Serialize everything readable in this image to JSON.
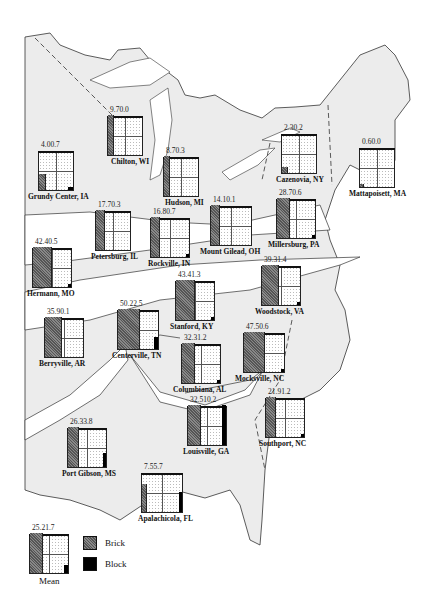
{
  "legend": {
    "brick": "Brick",
    "block": "Block"
  },
  "colors": {
    "land": "#ececec",
    "brick": "#6a6a6a",
    "block": "#000000",
    "border": "#222222"
  },
  "mean": {
    "label": "Mean",
    "brick": "25.2",
    "block": "1.7"
  },
  "sites": [
    {
      "name": "Grundy Center, IA",
      "brick": "4.0",
      "block": "0.7"
    },
    {
      "name": "Chilton, WI",
      "brick": "9.7",
      "block": "0.0"
    },
    {
      "name": "Hudson, MI",
      "brick": "8.7",
      "block": "0.3"
    },
    {
      "name": "Cazenovia, NY",
      "brick": "2.3",
      "block": "0.2"
    },
    {
      "name": "Mattapoisett, MA",
      "brick": "0.6",
      "block": "0.0"
    },
    {
      "name": "Petersburg, IL",
      "brick": "17.7",
      "block": "0.3"
    },
    {
      "name": "Rockville, IN",
      "brick": "16.8",
      "block": "0.7"
    },
    {
      "name": "Mount Gilead, OH",
      "brick": "14.1",
      "block": "0.1"
    },
    {
      "name": "Millersburg, PA",
      "brick": "28.7",
      "block": "0.6"
    },
    {
      "name": "Hermann, MO",
      "brick": "42.4",
      "block": "0.5"
    },
    {
      "name": "Stanford, KY",
      "brick": "43.4",
      "block": "1.3"
    },
    {
      "name": "Woodstock, VA",
      "brick": "39.3",
      "block": "1.4"
    },
    {
      "name": "Berryville, AR",
      "brick": "35.9",
      "block": "0.1"
    },
    {
      "name": "Centerville, TN",
      "brick": "50.2",
      "block": "2.5"
    },
    {
      "name": "Columbiana, AL",
      "brick": "32.3",
      "block": "1.2"
    },
    {
      "name": "Mocksville, NC",
      "brick": "47.5",
      "block": "0.6"
    },
    {
      "name": "Port Gibson, MS",
      "brick": "26.3",
      "block": "3.8"
    },
    {
      "name": "Louisville, GA",
      "brick": "32.5",
      "block": "10.2"
    },
    {
      "name": "Southport, NC",
      "brick": "21.9",
      "block": "1.2"
    },
    {
      "name": "Apalachicola, FL",
      "brick": "7.5",
      "block": "5.7"
    }
  ]
}
